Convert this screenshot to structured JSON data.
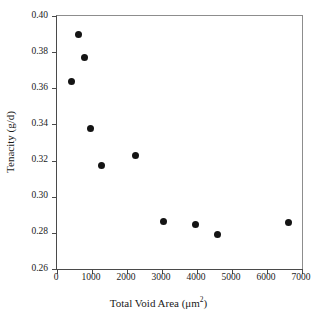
{
  "chart_data": {
    "type": "scatter",
    "title": "",
    "xlabel": "Total Void Area (μm²)",
    "xlabel_base": "Total Void Area (μm",
    "xlabel_sup": "2",
    "xlabel_close": ")",
    "ylabel": "Tenacity (g/d)",
    "xlim": [
      0,
      7000
    ],
    "ylim": [
      0.26,
      0.4
    ],
    "xticks": [
      0,
      1000,
      2000,
      3000,
      4000,
      5000,
      6000,
      7000
    ],
    "xticklabels": [
      "0",
      "1000",
      "2000",
      "3000",
      "4000",
      "5000",
      "6000",
      "7000"
    ],
    "yticks": [
      0.26,
      0.28,
      0.3,
      0.32,
      0.34,
      0.36,
      0.38,
      0.4
    ],
    "yticklabels": [
      "0.26",
      "0.28",
      "0.30",
      "0.32",
      "0.34",
      "0.36",
      "0.38",
      "0.40"
    ],
    "grid": false,
    "legend": false,
    "marker": "filled-circle",
    "marker_color": "#141414",
    "marker_size_px": 7,
    "points": [
      {
        "x": 400,
        "y": 0.364
      },
      {
        "x": 600,
        "y": 0.39
      },
      {
        "x": 790,
        "y": 0.377
      },
      {
        "x": 950,
        "y": 0.338
      },
      {
        "x": 1280,
        "y": 0.317
      },
      {
        "x": 2250,
        "y": 0.323
      },
      {
        "x": 3050,
        "y": 0.2865
      },
      {
        "x": 3960,
        "y": 0.2845
      },
      {
        "x": 4580,
        "y": 0.279
      },
      {
        "x": 6600,
        "y": 0.2855
      }
    ]
  },
  "colors": {
    "axis": "#4a4a4a",
    "frame_light": "#8d8d8d",
    "marker": "#141414",
    "background": "#ffffff",
    "text": "#1a1a1a"
  }
}
